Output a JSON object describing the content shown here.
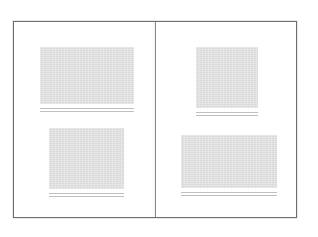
{
  "document": {
    "type": "book-spread",
    "page_count_visible": 2,
    "sheet_border_color": "#6e6e70",
    "gutter_color": "#87878a",
    "background_color": "#ffffff",
    "figure_fill_color": "#d9d9d9",
    "caption_rule_color": "#bfbfbf"
  },
  "pages": [
    {
      "side": "left",
      "name": "left-page",
      "figures": [
        {
          "name": "figure-top-left",
          "position": "top",
          "fill": "#d9d9d9",
          "caption_lines": 2
        },
        {
          "name": "figure-bottom-left",
          "position": "bottom",
          "fill": "#d9d9d9",
          "caption_lines": 2
        }
      ]
    },
    {
      "side": "right",
      "name": "right-page",
      "figures": [
        {
          "name": "figure-top-right",
          "position": "top",
          "fill": "#d9d9d9",
          "caption_lines": 2
        },
        {
          "name": "figure-bottom-right",
          "position": "bottom",
          "fill": "#d9d9d9",
          "caption_lines": 2
        }
      ]
    }
  ]
}
